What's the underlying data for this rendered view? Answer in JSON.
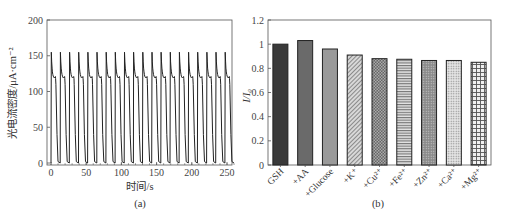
{
  "chart_data": [
    {
      "panel": "(a)",
      "type": "line",
      "title": "",
      "xlabel": "时间/s",
      "ylabel": "光电流密度/μA·cm⁻²",
      "xlim": [
        -3,
        265
      ],
      "ylim": [
        -3,
        200
      ],
      "xticks": [
        0,
        50,
        100,
        150,
        200,
        250
      ],
      "yticks": [
        0,
        50,
        100,
        150,
        200
      ],
      "grid": false,
      "legend": null,
      "description": "Repeated on/off photocurrent response: 20 cycles, period ≈13 s; on-spike ≈155 decaying to ≈118, off returns to ≈0",
      "cycles": 20,
      "period_s": 13,
      "peak_value": 155,
      "plateau_value": 118,
      "off_value": 0
    },
    {
      "panel": "(b)",
      "type": "bar",
      "title": "",
      "xlabel": "",
      "ylabel": "I/I₀",
      "ylim": [
        0,
        1.2
      ],
      "yticks": [
        0,
        0.2,
        0.4,
        0.6,
        0.8,
        1,
        1.2
      ],
      "grid": false,
      "legend": null,
      "categories": [
        "GSH",
        "+AA",
        "+Glucose",
        "+K⁺",
        "+Cu²⁺",
        "+Fe²⁺",
        "+Zn²⁺",
        "+Ca²⁺",
        "+Mg²⁺"
      ],
      "values": [
        1.0,
        1.03,
        0.96,
        0.91,
        0.88,
        0.875,
        0.865,
        0.865,
        0.85
      ],
      "fills": [
        "solid-dark",
        "solid-mid",
        "solid-light",
        "diagonal-hatch",
        "crosshatch-dark",
        "horizontal-lines",
        "dots-dense",
        "dots-light",
        "grid"
      ]
    }
  ],
  "panel_a": {
    "ylabel": "光电流密度/μA·cm⁻²",
    "xlabel": "时间/s",
    "caption": "(a)",
    "yticks": [
      "0",
      "50",
      "100",
      "150",
      "200"
    ],
    "xticks": [
      "0",
      "50",
      "100",
      "150",
      "200",
      "250"
    ]
  },
  "panel_b": {
    "ylabel": "I/I₀",
    "caption": "(b)",
    "yticks": [
      "0",
      "0.2",
      "0.4",
      "0.6",
      "0.8",
      "1",
      "1.2"
    ],
    "categories": [
      "GSH",
      "+AA",
      "+Glucose",
      "+K⁺",
      "+Cu²⁺",
      "+Fe²⁺",
      "+Zn²⁺",
      "+Ca²⁺",
      "+Mg²⁺"
    ]
  }
}
